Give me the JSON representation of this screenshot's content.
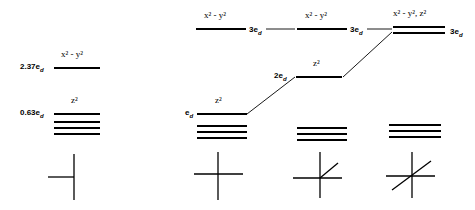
{
  "figure": {
    "type": "energy-level-diagram",
    "title_visible": false,
    "background": "#ffffff",
    "line_color": "#000000",
    "panels": [
      {
        "id": "panel-1",
        "geometry_icon": "linear-vertical-with-left-arm",
        "levels": [
          {
            "name": "x2-y2",
            "label": "x² - y²",
            "energy": "2.37eₓ",
            "energy_text": "2.37e",
            "energy_sub": "d",
            "y": 67,
            "degeneracy": 1
          },
          {
            "name": "z2",
            "label": "z²",
            "energy": "0.63eₓ",
            "energy_text": "0.63e",
            "energy_sub": "d",
            "y": 113,
            "degeneracy": 1
          },
          {
            "name": "lower-set",
            "label": "",
            "energy": "",
            "y": 121,
            "degeneracy": 3
          }
        ]
      },
      {
        "id": "panel-2",
        "geometry_icon": "cross-plain",
        "levels": [
          {
            "name": "x2-y2",
            "label": "x² - y²",
            "energy_text": "3e",
            "energy_sub": "d",
            "y": 28,
            "degeneracy": 1
          },
          {
            "name": "z2",
            "label": "z²",
            "energy_text": "e",
            "energy_sub": "d",
            "y": 113,
            "degeneracy": 1
          },
          {
            "name": "lower-set",
            "label": "",
            "energy_text": "",
            "y": 125,
            "degeneracy": 3
          }
        ]
      },
      {
        "id": "panel-3",
        "geometry_icon": "cross-with-one-diagonal",
        "levels": [
          {
            "name": "x2-y2",
            "label": "x² - y²",
            "energy_text": "3e",
            "energy_sub": "d",
            "y": 28,
            "degeneracy": 1
          },
          {
            "name": "z2",
            "label": "z²",
            "energy_text": "2e",
            "energy_sub": "d",
            "y": 76,
            "degeneracy": 1
          },
          {
            "name": "lower-set",
            "label": "",
            "energy_text": "",
            "y": 127,
            "degeneracy": 3
          }
        ]
      },
      {
        "id": "panel-4",
        "geometry_icon": "cross-with-full-diagonal",
        "levels": [
          {
            "name": "x2-y2-z2",
            "label": "x² - y², z²",
            "energy_text": "3e",
            "energy_sub": "d",
            "y": 28,
            "degeneracy": 2
          },
          {
            "name": "lower-set",
            "label": "",
            "energy_text": "",
            "y": 124,
            "degeneracy": 3
          }
        ]
      }
    ],
    "labels": {
      "x2_minus_y2": "x² - y²",
      "x2_minus_y2_z2": "x² - y², z²",
      "z2": "z²",
      "e_d": "e",
      "two_e_d": "2e",
      "three_e_d": "3e",
      "sub_d": "d",
      "energy_237": "2.37e",
      "energy_063": "0.63e"
    }
  }
}
